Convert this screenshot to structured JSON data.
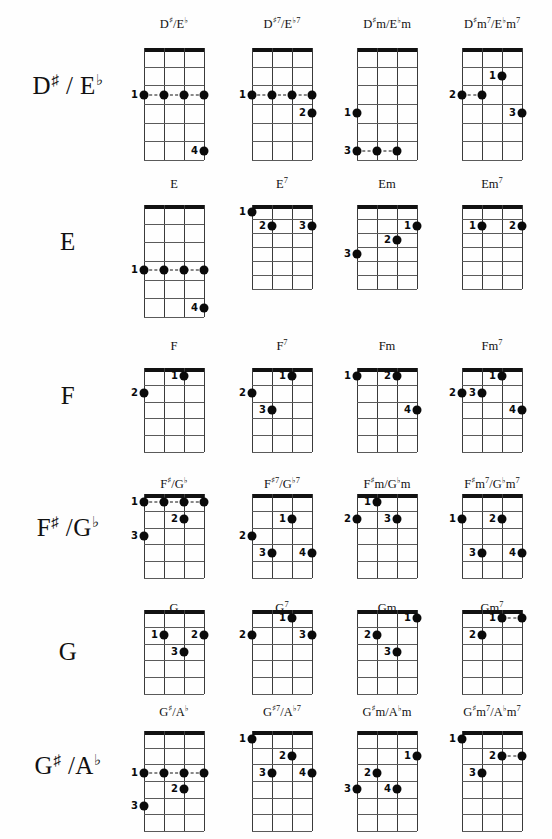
{
  "page": {
    "width": 552,
    "height": 839,
    "strings": 4,
    "note": "Each diagram shows a 4-string fretboard grid with finger-number labels and filled dots."
  },
  "rows": [
    {
      "label_html": "D<sup>♯</sup> / E<sup>♭</sup>",
      "label_text": "D# / Eb",
      "top": 18,
      "label_top": 72,
      "grid_top": 48,
      "frets": 6,
      "chords": [
        {
          "name_text": "D#/Eb",
          "name_html": "D<sup class=\"acc\">♯</sup>/E<sup class=\"accb\">♭</sup>",
          "cx": 174,
          "grid_w": 60,
          "grid_h": 112,
          "barres": [
            {
              "fret": 3,
              "from": 1,
              "to": 4,
              "finger": "1"
            }
          ],
          "dots": [
            {
              "string": 1,
              "fret": 3,
              "finger": "1"
            },
            {
              "string": 2,
              "fret": 3,
              "finger": ""
            },
            {
              "string": 3,
              "fret": 3,
              "finger": ""
            },
            {
              "string": 4,
              "fret": 3,
              "finger": ""
            },
            {
              "string": 4,
              "fret": 6,
              "finger": "4"
            }
          ]
        },
        {
          "name_text": "D#7/Eb7",
          "name_html": "D<sup class=\"acc\">♯</sup><sup>7</sup>/E<sup class=\"accb\">♭</sup><sup>7</sup>",
          "cx": 282,
          "grid_w": 60,
          "grid_h": 112,
          "barres": [
            {
              "fret": 3,
              "from": 1,
              "to": 4,
              "finger": "1"
            }
          ],
          "dots": [
            {
              "string": 1,
              "fret": 3,
              "finger": "1"
            },
            {
              "string": 2,
              "fret": 3,
              "finger": ""
            },
            {
              "string": 3,
              "fret": 3,
              "finger": ""
            },
            {
              "string": 4,
              "fret": 3,
              "finger": ""
            },
            {
              "string": 4,
              "fret": 4,
              "finger": "2"
            }
          ]
        },
        {
          "name_text": "D#m/Ebm",
          "name_html": "D<sup class=\"acc\">♯</sup>m/E<sup class=\"accb\">♭</sup>m",
          "cx": 387,
          "grid_w": 60,
          "grid_h": 112,
          "barres": [
            {
              "fret": 6,
              "from": 1,
              "to": 3,
              "finger": "3"
            }
          ],
          "dots": [
            {
              "string": 1,
              "fret": 4,
              "finger": "1"
            },
            {
              "string": 1,
              "fret": 6,
              "finger": "3"
            },
            {
              "string": 2,
              "fret": 6,
              "finger": ""
            },
            {
              "string": 3,
              "fret": 6,
              "finger": ""
            }
          ]
        },
        {
          "name_text": "D#m7/Ebm7",
          "name_html": "D<sup class=\"acc\">♯</sup>m<sup>7</sup>/E<sup class=\"accb\">♭</sup>m<sup>7</sup>",
          "cx": 492,
          "grid_w": 60,
          "grid_h": 112,
          "barres": [
            {
              "fret": 3,
              "from": 1,
              "to": 2,
              "finger": "2"
            }
          ],
          "dots": [
            {
              "string": 3,
              "fret": 2,
              "finger": "1"
            },
            {
              "string": 1,
              "fret": 3,
              "finger": "2"
            },
            {
              "string": 2,
              "fret": 3,
              "finger": ""
            },
            {
              "string": 4,
              "fret": 4,
              "finger": "3"
            }
          ]
        }
      ]
    },
    {
      "label_html": "E",
      "label_text": "E",
      "top": 178,
      "label_top": 228,
      "grid_top": 205,
      "frets": 6,
      "chords": [
        {
          "name_text": "E",
          "name_html": "E",
          "cx": 174,
          "grid_w": 60,
          "grid_h": 112,
          "barres": [
            {
              "fret": 4,
              "from": 1,
              "to": 4,
              "finger": "1"
            }
          ],
          "dots": [
            {
              "string": 1,
              "fret": 4,
              "finger": "1"
            },
            {
              "string": 2,
              "fret": 4,
              "finger": ""
            },
            {
              "string": 3,
              "fret": 4,
              "finger": ""
            },
            {
              "string": 4,
              "fret": 4,
              "finger": ""
            },
            {
              "string": 4,
              "fret": 6,
              "finger": "4"
            }
          ]
        },
        {
          "name_text": "E7",
          "name_html": "E<sup>7</sup>",
          "cx": 282,
          "grid_w": 60,
          "grid_h": 84,
          "barres": [],
          "dots": [
            {
              "string": 1,
              "fret": 1,
              "finger": "1"
            },
            {
              "string": 2,
              "fret": 2,
              "finger": "2"
            },
            {
              "string": 4,
              "fret": 2,
              "finger": "3"
            }
          ]
        },
        {
          "name_text": "Em",
          "name_html": "Em",
          "cx": 387,
          "grid_w": 60,
          "grid_h": 84,
          "barres": [],
          "dots": [
            {
              "string": 4,
              "fret": 2,
              "finger": "1"
            },
            {
              "string": 3,
              "fret": 3,
              "finger": "2"
            },
            {
              "string": 1,
              "fret": 4,
              "finger": "3"
            }
          ]
        },
        {
          "name_text": "Em7",
          "name_html": "Em<sup>7</sup>",
          "cx": 492,
          "grid_w": 60,
          "grid_h": 84,
          "barres": [],
          "dots": [
            {
              "string": 2,
              "fret": 2,
              "finger": "1"
            },
            {
              "string": 4,
              "fret": 2,
              "finger": "2"
            }
          ]
        }
      ]
    },
    {
      "label_html": "F",
      "label_text": "F",
      "top": 340,
      "label_top": 382,
      "grid_top": 368,
      "frets": 5,
      "chords": [
        {
          "name_text": "F",
          "name_html": "F",
          "cx": 174,
          "grid_w": 60,
          "grid_h": 84,
          "barres": [],
          "dots": [
            {
              "string": 3,
              "fret": 1,
              "finger": "1"
            },
            {
              "string": 1,
              "fret": 2,
              "finger": "2"
            }
          ]
        },
        {
          "name_text": "F7",
          "name_html": "F<sup>7</sup>",
          "cx": 282,
          "grid_w": 60,
          "grid_h": 84,
          "barres": [],
          "dots": [
            {
              "string": 3,
              "fret": 1,
              "finger": "1"
            },
            {
              "string": 1,
              "fret": 2,
              "finger": "2"
            },
            {
              "string": 2,
              "fret": 3,
              "finger": "3"
            }
          ]
        },
        {
          "name_text": "Fm",
          "name_html": "Fm",
          "cx": 387,
          "grid_w": 60,
          "grid_h": 84,
          "barres": [],
          "dots": [
            {
              "string": 1,
              "fret": 1,
              "finger": "1"
            },
            {
              "string": 3,
              "fret": 1,
              "finger": "2"
            },
            {
              "string": 4,
              "fret": 3,
              "finger": "4"
            }
          ]
        },
        {
          "name_text": "Fm7",
          "name_html": "Fm<sup>7</sup>",
          "cx": 492,
          "grid_w": 60,
          "grid_h": 84,
          "barres": [],
          "dots": [
            {
              "string": 3,
              "fret": 1,
              "finger": "1"
            },
            {
              "string": 1,
              "fret": 2,
              "finger": "2"
            },
            {
              "string": 2,
              "fret": 2,
              "finger": "3"
            },
            {
              "string": 4,
              "fret": 3,
              "finger": "4"
            }
          ]
        }
      ]
    },
    {
      "label_html": "F<sup>♯</sup> /G<sup>♭</sup>",
      "label_text": "F# /Gb",
      "top": 478,
      "label_top": 514,
      "grid_top": 494,
      "frets": 5,
      "chords": [
        {
          "name_text": "F#/Gb",
          "name_html": "F<sup class=\"acc\">♯</sup>/G<sup class=\"accb\">♭</sup>",
          "cx": 174,
          "grid_w": 60,
          "grid_h": 84,
          "barres": [
            {
              "fret": 1,
              "from": 1,
              "to": 4,
              "finger": "1"
            }
          ],
          "dots": [
            {
              "string": 1,
              "fret": 1,
              "finger": "1"
            },
            {
              "string": 2,
              "fret": 1,
              "finger": ""
            },
            {
              "string": 3,
              "fret": 1,
              "finger": ""
            },
            {
              "string": 4,
              "fret": 1,
              "finger": ""
            },
            {
              "string": 3,
              "fret": 2,
              "finger": "2"
            },
            {
              "string": 1,
              "fret": 3,
              "finger": "3"
            }
          ]
        },
        {
          "name_text": "F#7/Gb7",
          "name_html": "F<sup class=\"acc\">♯</sup><sup>7</sup>/G<sup class=\"accb\">♭</sup><sup>7</sup>",
          "cx": 282,
          "grid_w": 60,
          "grid_h": 84,
          "barres": [],
          "dots": [
            {
              "string": 3,
              "fret": 2,
              "finger": "1"
            },
            {
              "string": 1,
              "fret": 3,
              "finger": "2"
            },
            {
              "string": 2,
              "fret": 4,
              "finger": "3"
            },
            {
              "string": 4,
              "fret": 4,
              "finger": "4"
            }
          ]
        },
        {
          "name_text": "F#m/Gbm",
          "name_html": "F<sup class=\"acc\">♯</sup>m/G<sup class=\"accb\">♭</sup>m",
          "cx": 387,
          "grid_w": 60,
          "grid_h": 84,
          "barres": [],
          "dots": [
            {
              "string": 2,
              "fret": 1,
              "finger": "1"
            },
            {
              "string": 1,
              "fret": 2,
              "finger": "2"
            },
            {
              "string": 3,
              "fret": 2,
              "finger": "3"
            }
          ]
        },
        {
          "name_text": "F#m7/Gbm7",
          "name_html": "F<sup class=\"acc\">♯</sup>m<sup>7</sup>/G<sup class=\"accb\">♭</sup>m<sup>7</sup>",
          "cx": 492,
          "grid_w": 60,
          "grid_h": 84,
          "barres": [],
          "dots": [
            {
              "string": 1,
              "fret": 2,
              "finger": "1"
            },
            {
              "string": 3,
              "fret": 2,
              "finger": "2"
            },
            {
              "string": 2,
              "fret": 4,
              "finger": "3"
            },
            {
              "string": 4,
              "fret": 4,
              "finger": "4"
            }
          ]
        }
      ]
    },
    {
      "label_html": "G",
      "label_top": 638,
      "label_text": "G",
      "top": 602,
      "grid_top": 610,
      "frets": 5,
      "chords": [
        {
          "name_text": "G",
          "name_html": "G",
          "cx": 174,
          "grid_w": 60,
          "grid_h": 84,
          "barres": [],
          "dots": [
            {
              "string": 2,
              "fret": 2,
              "finger": "1"
            },
            {
              "string": 4,
              "fret": 2,
              "finger": "2"
            },
            {
              "string": 3,
              "fret": 3,
              "finger": "3"
            }
          ]
        },
        {
          "name_text": "G7",
          "name_html": "G<sup>7</sup>",
          "cx": 282,
          "grid_w": 60,
          "grid_h": 84,
          "barres": [],
          "dots": [
            {
              "string": 3,
              "fret": 1,
              "finger": "1"
            },
            {
              "string": 1,
              "fret": 2,
              "finger": "2"
            },
            {
              "string": 4,
              "fret": 2,
              "finger": "3"
            }
          ]
        },
        {
          "name_text": "Gm",
          "name_html": "Gm",
          "cx": 387,
          "grid_w": 60,
          "grid_h": 84,
          "barres": [],
          "dots": [
            {
              "string": 4,
              "fret": 1,
              "finger": "1"
            },
            {
              "string": 2,
              "fret": 2,
              "finger": "2"
            },
            {
              "string": 3,
              "fret": 3,
              "finger": "3"
            }
          ]
        },
        {
          "name_text": "Gm7",
          "name_html": "Gm<sup>7</sup>",
          "cx": 492,
          "grid_w": 60,
          "grid_h": 84,
          "barres": [
            {
              "fret": 1,
              "from": 3,
              "to": 4,
              "finger": "1"
            }
          ],
          "dots": [
            {
              "string": 3,
              "fret": 1,
              "finger": "1"
            },
            {
              "string": 4,
              "fret": 1,
              "finger": ""
            },
            {
              "string": 2,
              "fret": 2,
              "finger": "2"
            }
          ]
        }
      ]
    },
    {
      "label_html": "G<sup>♯</sup> /A<sup>♭</sup>",
      "label_text": "G# /Ab",
      "top": 706,
      "label_top": 752,
      "grid_top": 731,
      "frets": 6,
      "chords": [
        {
          "name_text": "G#/Ab",
          "name_html": "G<sup class=\"acc\">♯</sup>/A<sup class=\"accb\">♭</sup>",
          "cx": 174,
          "grid_w": 60,
          "grid_h": 100,
          "barres": [
            {
              "fret": 3,
              "from": 1,
              "to": 4,
              "finger": "1"
            }
          ],
          "dots": [
            {
              "string": 1,
              "fret": 3,
              "finger": "1"
            },
            {
              "string": 2,
              "fret": 3,
              "finger": ""
            },
            {
              "string": 3,
              "fret": 3,
              "finger": ""
            },
            {
              "string": 4,
              "fret": 3,
              "finger": ""
            },
            {
              "string": 3,
              "fret": 4,
              "finger": "2"
            },
            {
              "string": 1,
              "fret": 5,
              "finger": "3"
            }
          ]
        },
        {
          "name_text": "G#7/Ab7",
          "name_html": "G<sup class=\"acc\">♯</sup><sup>7</sup>/A<sup class=\"accb\">♭</sup><sup>7</sup>",
          "cx": 282,
          "grid_w": 60,
          "grid_h": 100,
          "barres": [],
          "dots": [
            {
              "string": 1,
              "fret": 1,
              "finger": "1"
            },
            {
              "string": 3,
              "fret": 2,
              "finger": "2"
            },
            {
              "string": 2,
              "fret": 3,
              "finger": "3"
            },
            {
              "string": 4,
              "fret": 3,
              "finger": "4"
            }
          ]
        },
        {
          "name_text": "G#m/Abm",
          "name_html": "G<sup class=\"acc\">♯</sup>m/A<sup class=\"accb\">♭</sup>m",
          "cx": 387,
          "grid_w": 60,
          "grid_h": 100,
          "barres": [],
          "dots": [
            {
              "string": 4,
              "fret": 2,
              "finger": "1"
            },
            {
              "string": 2,
              "fret": 3,
              "finger": "2"
            },
            {
              "string": 1,
              "fret": 4,
              "finger": "3"
            },
            {
              "string": 3,
              "fret": 4,
              "finger": "4"
            }
          ]
        },
        {
          "name_text": "G#m7/Abm7",
          "name_html": "G<sup class=\"acc\">♯</sup>m<sup>7</sup>/A<sup class=\"accb\">♭</sup>m<sup>7</sup>",
          "cx": 492,
          "grid_w": 60,
          "grid_h": 100,
          "barres": [
            {
              "fret": 2,
              "from": 3,
              "to": 4,
              "finger": "2"
            }
          ],
          "dots": [
            {
              "string": 1,
              "fret": 1,
              "finger": "1"
            },
            {
              "string": 3,
              "fret": 2,
              "finger": "2"
            },
            {
              "string": 4,
              "fret": 2,
              "finger": ""
            },
            {
              "string": 2,
              "fret": 3,
              "finger": "3"
            }
          ]
        }
      ]
    }
  ]
}
